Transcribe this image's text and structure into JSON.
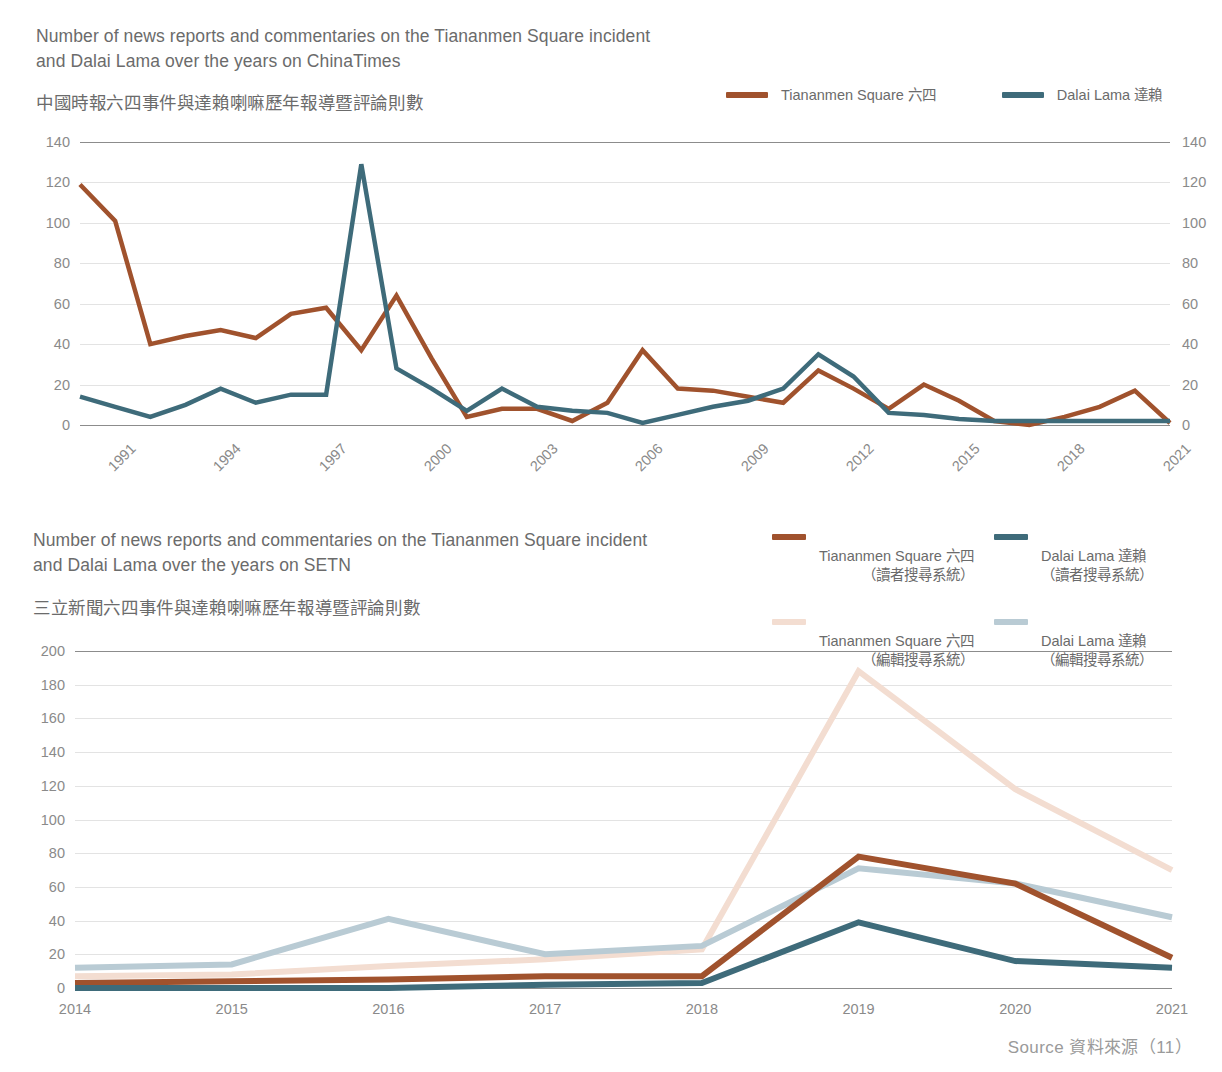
{
  "colors": {
    "tiananmen_dark": "#A0522D",
    "dalai_dark": "#3E6B7A",
    "tiananmen_light": "#F3DDD1",
    "dalai_light": "#B9CBD4",
    "axis": "#8c8c8c",
    "grid": "#e3e3e3",
    "text": "#6b6b6b",
    "tick_text": "#8a8a8a"
  },
  "chart1": {
    "title_en": "Number of news reports and commentaries on the Tiananmen Square incident\nand Dalai Lama over the years on ChinaTimes",
    "title_zh": "中國時報六四事件與達賴喇嘛歷年報導暨評論則數",
    "legend": [
      {
        "label": "Tiananmen Square 六四",
        "color_key": "tiananmen_dark"
      },
      {
        "label": "Dalai Lama 達賴",
        "color_key": "dalai_dark"
      }
    ]
  },
  "chart2": {
    "title_en": "Number of news reports and commentaries on the Tiananmen Square incident\nand Dalai Lama over the years on SETN",
    "title_zh": "三立新聞六四事件與達賴喇嘛歷年報導暨評論則數",
    "legend": [
      {
        "line1": "Tiananmen Square 六四",
        "line2": "（讀者搜尋系統）",
        "color_key": "tiananmen_dark"
      },
      {
        "line1": "Dalai Lama 達賴",
        "line2": "（讀者搜尋系統）",
        "color_key": "dalai_dark"
      },
      {
        "line1": "Tiananmen Square 六四",
        "line2": "（編輯搜尋系統）",
        "color_key": "tiananmen_light"
      },
      {
        "line1": "Dalai Lama 達賴",
        "line2": "（編輯搜尋系統）",
        "color_key": "dalai_light"
      }
    ]
  },
  "footer": {
    "source": "Source 資料來源（11）"
  },
  "chart_data": [
    {
      "id": "chinatimes",
      "type": "line",
      "title": "Number of news reports and commentaries on the Tiananmen Square incident and Dalai Lama over the years on ChinaTimes",
      "title_zh": "中國時報六四事件與達賴喇嘛歷年報導暨評論則數",
      "xlabel": "",
      "ylabel": "",
      "ylim": [
        0,
        140
      ],
      "ytick_step": 20,
      "yticks": [
        0,
        20,
        40,
        60,
        80,
        100,
        120,
        140
      ],
      "dual_y_axis": true,
      "grid": true,
      "legend_position": "top-right",
      "x": [
        1991,
        1992,
        1993,
        1994,
        1995,
        1996,
        1997,
        1998,
        1999,
        2000,
        2001,
        2002,
        2003,
        2004,
        2005,
        2006,
        2007,
        2008,
        2009,
        2010,
        2011,
        2012,
        2013,
        2014,
        2015,
        2016,
        2017,
        2018,
        2019,
        2020,
        2021,
        2022
      ],
      "xtick_labels": [
        "1991",
        "1994",
        "1997",
        "2000",
        "2003",
        "2006",
        "2009",
        "2012",
        "2015",
        "2018",
        "2021"
      ],
      "xtick_rotation": -45,
      "series": [
        {
          "name": "Tiananmen Square 六四",
          "color": "#A0522D",
          "values": [
            119,
            101,
            40,
            44,
            47,
            43,
            55,
            58,
            37,
            64,
            33,
            4,
            8,
            8,
            2,
            11,
            37,
            18,
            17,
            14,
            11,
            27,
            18,
            8,
            20,
            12,
            2,
            0,
            4,
            9,
            17,
            1
          ]
        },
        {
          "name": "Dalai Lama 達賴",
          "color": "#3E6B7A",
          "values": [
            14,
            9,
            4,
            10,
            18,
            11,
            15,
            15,
            129,
            28,
            18,
            7,
            18,
            9,
            7,
            6,
            1,
            5,
            9,
            12,
            18,
            35,
            24,
            6,
            5,
            3,
            2,
            2,
            2,
            2,
            2,
            2
          ]
        }
      ]
    },
    {
      "id": "setn",
      "type": "line",
      "title": "Number of news reports and commentaries on the Tiananmen Square incident and Dalai Lama over the years on SETN",
      "title_zh": "三立新聞六四事件與達賴喇嘛歷年報導暨評論則數",
      "xlabel": "",
      "ylabel": "",
      "ylim": [
        0,
        200
      ],
      "ytick_step": 20,
      "yticks": [
        0,
        20,
        40,
        60,
        80,
        100,
        120,
        140,
        160,
        180,
        200
      ],
      "grid": true,
      "legend_position": "top-right",
      "x": [
        2014,
        2015,
        2016,
        2017,
        2018,
        2019,
        2020,
        2021
      ],
      "xtick_labels": [
        "2014",
        "2015",
        "2016",
        "2017",
        "2018",
        "2019",
        "2020",
        "2021"
      ],
      "series": [
        {
          "name": "Tiananmen Square 六四（讀者搜尋系統）",
          "color": "#A0522D",
          "values": [
            3,
            4,
            5,
            7,
            7,
            78,
            62,
            18
          ]
        },
        {
          "name": "Dalai Lama 達賴（讀者搜尋系統）",
          "color": "#3E6B7A",
          "values": [
            0,
            0,
            0,
            2,
            3,
            39,
            16,
            12
          ]
        },
        {
          "name": "Tiananmen Square 六四（編輯搜尋系統）",
          "color": "#F3DDD1",
          "values": [
            7,
            8,
            13,
            17,
            23,
            188,
            118,
            70
          ]
        },
        {
          "name": "Dalai Lama 達賴（編輯搜尋系統）",
          "color": "#B9CBD4",
          "values": [
            12,
            14,
            41,
            20,
            25,
            71,
            62,
            42
          ]
        }
      ]
    }
  ]
}
